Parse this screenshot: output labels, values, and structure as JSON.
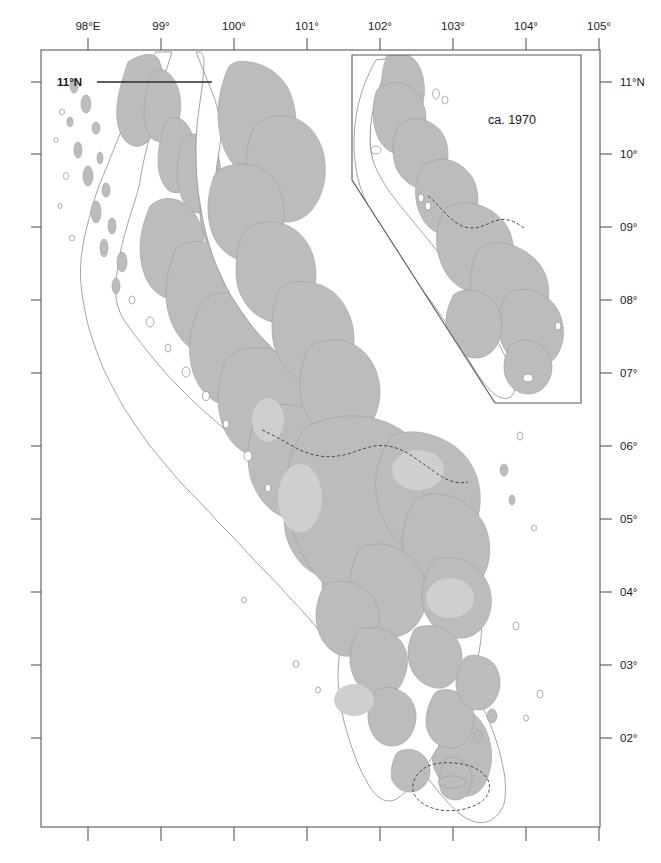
{
  "figure": {
    "type": "map",
    "background_color": "#ffffff",
    "forest_fill_color": "#bcbcbc",
    "coastline_color": "#8a8d90",
    "frame_color": "#555a5e"
  },
  "axes": {
    "top": {
      "label_suffix": "°",
      "ticks": [
        {
          "label": "98°E",
          "x": 88
        },
        {
          "label": "99°",
          "x": 161
        },
        {
          "label": "100°",
          "x": 234
        },
        {
          "label": "101°",
          "x": 307
        },
        {
          "label": "102°",
          "x": 380
        },
        {
          "label": "103°",
          "x": 453
        },
        {
          "label": "104°",
          "x": 526
        },
        {
          "label": "105°",
          "x": 599
        }
      ]
    },
    "right": {
      "ticks": [
        {
          "label": "11°N",
          "y": 82
        },
        {
          "label": "10°",
          "y": 154
        },
        {
          "label": "09°",
          "y": 227
        },
        {
          "label": "08°",
          "y": 300
        },
        {
          "label": "07°",
          "y": 373
        },
        {
          "label": "06°",
          "y": 446
        },
        {
          "label": "05°",
          "y": 519
        },
        {
          "label": "04°",
          "y": 592
        },
        {
          "label": "03°",
          "y": 665
        },
        {
          "label": "02°",
          "y": 738
        }
      ]
    },
    "left": {
      "labelled": false,
      "tick_y": [
        82,
        154,
        227,
        300,
        373,
        446,
        519,
        592,
        665,
        738
      ]
    },
    "bottom": {
      "labelled": false,
      "tick_x": [
        88,
        161,
        234,
        307,
        380,
        453,
        526,
        599
      ]
    }
  },
  "frame": {
    "x": 41,
    "y": 50,
    "width": 559,
    "height": 777
  },
  "graticule": {
    "latitude_label": "11°N",
    "label_x": 57,
    "label_y": 86,
    "line_y": 82,
    "line_x1": 97,
    "line_x2": 212
  },
  "inset": {
    "label": "ca. 1970",
    "label_x": 512,
    "label_y": 124,
    "outline": "352,55 581,55 581,403 495,403 352,180",
    "frame": {
      "left": 352,
      "top": 55,
      "right": 581,
      "bottom": 403
    }
  },
  "legend_present": false
}
